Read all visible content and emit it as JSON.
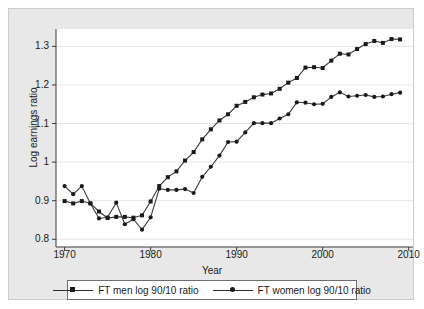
{
  "chart_data": {
    "type": "line",
    "title": "",
    "xlabel": "Year",
    "ylabel": "Log earnings ratio",
    "xlim": [
      1969,
      2010.5
    ],
    "ylim": [
      0.78,
      1.345
    ],
    "xticks": [
      1970,
      1980,
      1990,
      2000,
      2010
    ],
    "xtick_labels": [
      "1970",
      "1980",
      "1990",
      "2000",
      "2010"
    ],
    "yticks": [
      0.8,
      0.9,
      1.0,
      1.1,
      1.2,
      1.3
    ],
    "ytick_labels": [
      "0.8",
      "0.9",
      "1",
      "1.1",
      "1.2",
      "1.3"
    ],
    "grid": "horizontal",
    "legend_position": "bottom-outside",
    "marker_colors": {
      "men": "#1a1a1a",
      "women": "#1a1a1a"
    },
    "line_colors": {
      "men": "#3a3a3a",
      "women": "#3a3a3a"
    },
    "x": [
      1970,
      1971,
      1972,
      1973,
      1974,
      1975,
      1976,
      1977,
      1978,
      1979,
      1980,
      1981,
      1982,
      1983,
      1984,
      1985,
      1986,
      1987,
      1988,
      1989,
      1990,
      1991,
      1992,
      1993,
      1994,
      1995,
      1996,
      1997,
      1998,
      1999,
      2000,
      2001,
      2002,
      2003,
      2004,
      2005,
      2006,
      2007,
      2008,
      2009
    ],
    "series": [
      {
        "name": "FT men log 90/10 ratio",
        "marker": "square",
        "values": [
          0.899,
          0.893,
          0.899,
          0.893,
          0.872,
          0.855,
          0.858,
          0.858,
          0.856,
          0.862,
          0.898,
          0.938,
          0.961,
          0.976,
          1.004,
          1.026,
          1.059,
          1.085,
          1.108,
          1.124,
          1.146,
          1.156,
          1.168,
          1.175,
          1.178,
          1.19,
          1.206,
          1.218,
          1.245,
          1.246,
          1.244,
          1.263,
          1.281,
          1.279,
          1.293,
          1.306,
          1.314,
          1.309,
          1.319,
          1.318
        ]
      },
      {
        "name": "FT women log 90/10 ratio",
        "marker": "circle",
        "values": [
          0.938,
          0.917,
          0.938,
          0.893,
          0.854,
          0.857,
          0.895,
          0.839,
          0.852,
          0.825,
          0.857,
          0.931,
          0.928,
          0.928,
          0.93,
          0.92,
          0.962,
          0.988,
          1.017,
          1.052,
          1.053,
          1.077,
          1.101,
          1.101,
          1.101,
          1.113,
          1.124,
          1.155,
          1.154,
          1.15,
          1.151,
          1.169,
          1.181,
          1.17,
          1.172,
          1.174,
          1.169,
          1.17,
          1.176,
          1.18
        ]
      }
    ]
  },
  "axes": {
    "y_title": "Log earnings ratio",
    "x_title": "Year"
  },
  "legend": {
    "entries": [
      {
        "label": "FT men log 90/10 ratio",
        "marker": "square-marker"
      },
      {
        "label": "FT women log 90/10 ratio",
        "marker": "circle-marker"
      }
    ]
  }
}
